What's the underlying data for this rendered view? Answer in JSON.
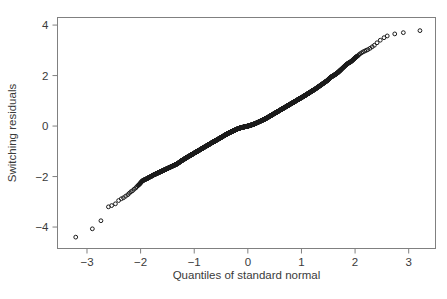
{
  "figure": {
    "background_color": "#ffffff",
    "axis_color": "#808080",
    "text_color": "#3a3a3a",
    "marker_color": "#1a1a1a"
  },
  "axes": {
    "x_axis_label": "Quantiles of standard normal",
    "y_axis_label": "Switching residuals",
    "x_tick_labels": [
      "−3",
      "−2",
      "−1",
      "0",
      "1",
      "2",
      "3"
    ],
    "y_tick_labels": [
      "4",
      "2",
      "0",
      "−2",
      "−4"
    ]
  },
  "chart_data": {
    "type": "scatter",
    "title": "",
    "xlabel": "Quantiles of standard normal",
    "ylabel": "Switching residuals",
    "xlim": [
      -3.55,
      3.5
    ],
    "ylim": [
      -4.85,
      4.3
    ],
    "xticks": [
      -3,
      -2,
      -1,
      0,
      1,
      2,
      3
    ],
    "yticks": [
      -4,
      -2,
      0,
      2,
      4
    ],
    "grid": false,
    "legend": null,
    "marker": "open-circle",
    "marker_size": 4,
    "x": [
      -3.21,
      -2.9,
      -2.74,
      -2.6,
      -2.54,
      -2.47,
      -2.41,
      -2.36,
      -2.32,
      -2.28,
      -2.24,
      -2.21,
      -2.18,
      -2.15,
      -2.12,
      -2.09,
      -2.07,
      -2.05,
      -2.02,
      -2.0,
      -1.98,
      -1.96,
      -1.94,
      -1.92,
      -1.9,
      -1.88,
      -1.86,
      -1.85,
      -1.83,
      -1.81,
      -1.79,
      -1.78,
      -1.76,
      -1.74,
      -1.72,
      -1.7,
      -1.68,
      -1.66,
      -1.64,
      -1.62,
      -1.6,
      -1.58,
      -1.56,
      -1.54,
      -1.52,
      -1.5,
      -1.48,
      -1.46,
      -1.44,
      -1.42,
      -1.4,
      -1.38,
      -1.36,
      -1.34,
      -1.32,
      -1.3,
      -1.28,
      -1.26,
      -1.24,
      -1.22,
      -1.2,
      -1.18,
      -1.16,
      -1.14,
      -1.12,
      -1.1,
      -1.08,
      -1.06,
      -1.04,
      -1.02,
      -1.0,
      -0.98,
      -0.96,
      -0.94,
      -0.92,
      -0.9,
      -0.88,
      -0.86,
      -0.84,
      -0.82,
      -0.8,
      -0.78,
      -0.76,
      -0.74,
      -0.72,
      -0.7,
      -0.68,
      -0.66,
      -0.64,
      -0.62,
      -0.6,
      -0.58,
      -0.56,
      -0.54,
      -0.52,
      -0.5,
      -0.48,
      -0.46,
      -0.44,
      -0.42,
      -0.4,
      -0.38,
      -0.36,
      -0.34,
      -0.32,
      -0.3,
      -0.28,
      -0.26,
      -0.24,
      -0.22,
      -0.2,
      -0.18,
      -0.16,
      -0.14,
      -0.12,
      -0.1,
      -0.08,
      -0.06,
      -0.04,
      -0.02,
      0.0,
      0.02,
      0.04,
      0.06,
      0.08,
      0.1,
      0.12,
      0.14,
      0.16,
      0.18,
      0.2,
      0.22,
      0.24,
      0.26,
      0.28,
      0.3,
      0.32,
      0.34,
      0.36,
      0.38,
      0.4,
      0.42,
      0.44,
      0.46,
      0.48,
      0.5,
      0.52,
      0.54,
      0.56,
      0.58,
      0.6,
      0.62,
      0.64,
      0.66,
      0.68,
      0.7,
      0.72,
      0.74,
      0.76,
      0.78,
      0.8,
      0.82,
      0.84,
      0.86,
      0.88,
      0.9,
      0.92,
      0.94,
      0.96,
      0.98,
      1.0,
      1.02,
      1.04,
      1.06,
      1.08,
      1.1,
      1.12,
      1.14,
      1.16,
      1.18,
      1.2,
      1.22,
      1.24,
      1.26,
      1.28,
      1.3,
      1.32,
      1.34,
      1.36,
      1.38,
      1.4,
      1.42,
      1.44,
      1.46,
      1.48,
      1.5,
      1.52,
      1.54,
      1.56,
      1.58,
      1.6,
      1.62,
      1.64,
      1.66,
      1.68,
      1.7,
      1.72,
      1.74,
      1.76,
      1.78,
      1.8,
      1.82,
      1.84,
      1.86,
      1.88,
      1.9,
      1.92,
      1.94,
      1.96,
      1.98,
      2.0,
      2.02,
      2.05,
      2.07,
      2.09,
      2.12,
      2.15,
      2.18,
      2.21,
      2.24,
      2.28,
      2.32,
      2.36,
      2.41,
      2.47,
      2.54,
      2.6,
      2.74,
      2.9,
      3.21
    ],
    "y": [
      -4.4,
      -4.07,
      -3.75,
      -3.2,
      -3.15,
      -3.08,
      -2.95,
      -2.88,
      -2.84,
      -2.78,
      -2.72,
      -2.66,
      -2.6,
      -2.56,
      -2.5,
      -2.45,
      -2.4,
      -2.36,
      -2.3,
      -2.25,
      -2.2,
      -2.16,
      -2.14,
      -2.12,
      -2.1,
      -2.08,
      -2.06,
      -2.04,
      -2.02,
      -2.0,
      -1.98,
      -1.96,
      -1.94,
      -1.92,
      -1.9,
      -1.88,
      -1.86,
      -1.84,
      -1.82,
      -1.8,
      -1.78,
      -1.76,
      -1.74,
      -1.72,
      -1.7,
      -1.68,
      -1.66,
      -1.64,
      -1.62,
      -1.6,
      -1.58,
      -1.56,
      -1.54,
      -1.52,
      -1.5,
      -1.47,
      -1.44,
      -1.41,
      -1.38,
      -1.35,
      -1.33,
      -1.3,
      -1.27,
      -1.25,
      -1.22,
      -1.2,
      -1.17,
      -1.15,
      -1.12,
      -1.1,
      -1.07,
      -1.05,
      -1.02,
      -1.0,
      -0.97,
      -0.95,
      -0.92,
      -0.9,
      -0.87,
      -0.85,
      -0.82,
      -0.8,
      -0.77,
      -0.75,
      -0.72,
      -0.7,
      -0.67,
      -0.65,
      -0.62,
      -0.6,
      -0.58,
      -0.55,
      -0.53,
      -0.5,
      -0.48,
      -0.45,
      -0.43,
      -0.4,
      -0.38,
      -0.35,
      -0.33,
      -0.3,
      -0.28,
      -0.26,
      -0.24,
      -0.22,
      -0.2,
      -0.18,
      -0.16,
      -0.14,
      -0.12,
      -0.1,
      -0.09,
      -0.07,
      -0.06,
      -0.05,
      -0.04,
      -0.03,
      -0.02,
      -0.01,
      0.0,
      0.01,
      0.02,
      0.04,
      0.05,
      0.07,
      0.08,
      0.1,
      0.12,
      0.14,
      0.16,
      0.18,
      0.2,
      0.22,
      0.24,
      0.26,
      0.28,
      0.3,
      0.33,
      0.35,
      0.38,
      0.4,
      0.43,
      0.45,
      0.48,
      0.5,
      0.53,
      0.55,
      0.58,
      0.6,
      0.63,
      0.65,
      0.68,
      0.7,
      0.73,
      0.75,
      0.78,
      0.8,
      0.83,
      0.85,
      0.88,
      0.9,
      0.93,
      0.95,
      0.98,
      1.0,
      1.03,
      1.05,
      1.08,
      1.1,
      1.13,
      1.15,
      1.18,
      1.2,
      1.23,
      1.26,
      1.28,
      1.31,
      1.34,
      1.36,
      1.39,
      1.42,
      1.44,
      1.47,
      1.5,
      1.53,
      1.56,
      1.59,
      1.62,
      1.65,
      1.68,
      1.71,
      1.74,
      1.77,
      1.8,
      1.84,
      1.88,
      1.92,
      1.95,
      1.98,
      2.0,
      2.03,
      2.06,
      2.09,
      2.12,
      2.16,
      2.2,
      2.24,
      2.28,
      2.32,
      2.36,
      2.4,
      2.44,
      2.47,
      2.5,
      2.52,
      2.55,
      2.58,
      2.62,
      2.66,
      2.7,
      2.74,
      2.78,
      2.82,
      2.86,
      2.9,
      2.94,
      2.97,
      3.0,
      3.03,
      3.08,
      3.14,
      3.2,
      3.3,
      3.4,
      3.5,
      3.57,
      3.65,
      3.7,
      3.78
    ]
  }
}
